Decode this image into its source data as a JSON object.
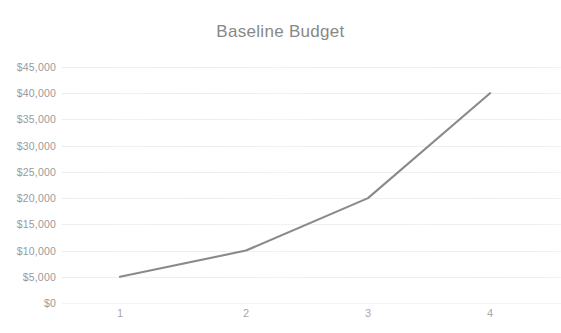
{
  "chart_data": {
    "type": "line",
    "title": "Baseline Budget",
    "xlabel": "",
    "ylabel": "",
    "x": [
      1,
      2,
      3,
      4
    ],
    "categories": [
      "1",
      "2",
      "3",
      "4"
    ],
    "values": [
      5000,
      10000,
      20000,
      40000
    ],
    "series": [
      {
        "name": "Baseline Budget",
        "values": [
          5000,
          10000,
          20000,
          40000
        ],
        "color": "#8a8a8a"
      }
    ],
    "ylim": [
      0,
      45000
    ],
    "ytick_values": [
      45000,
      40000,
      35000,
      30000,
      25000,
      20000,
      15000,
      10000,
      5000,
      0
    ],
    "ytick_labels": [
      "$45,000",
      "$40,000",
      "$35,000",
      "$30,000",
      "$25,000",
      "$20,000",
      "$15,000",
      "$10,000",
      "$5,000",
      "$0"
    ],
    "xtick_labels": [
      "1",
      "2",
      "3",
      "4"
    ],
    "grid": true,
    "legend": false,
    "legend_position": "none",
    "markers": false,
    "line_color": "#8a8a8a",
    "title_color": "#888888",
    "axis_label_color": "#9a9a9a",
    "background_color": "#ffffff"
  }
}
